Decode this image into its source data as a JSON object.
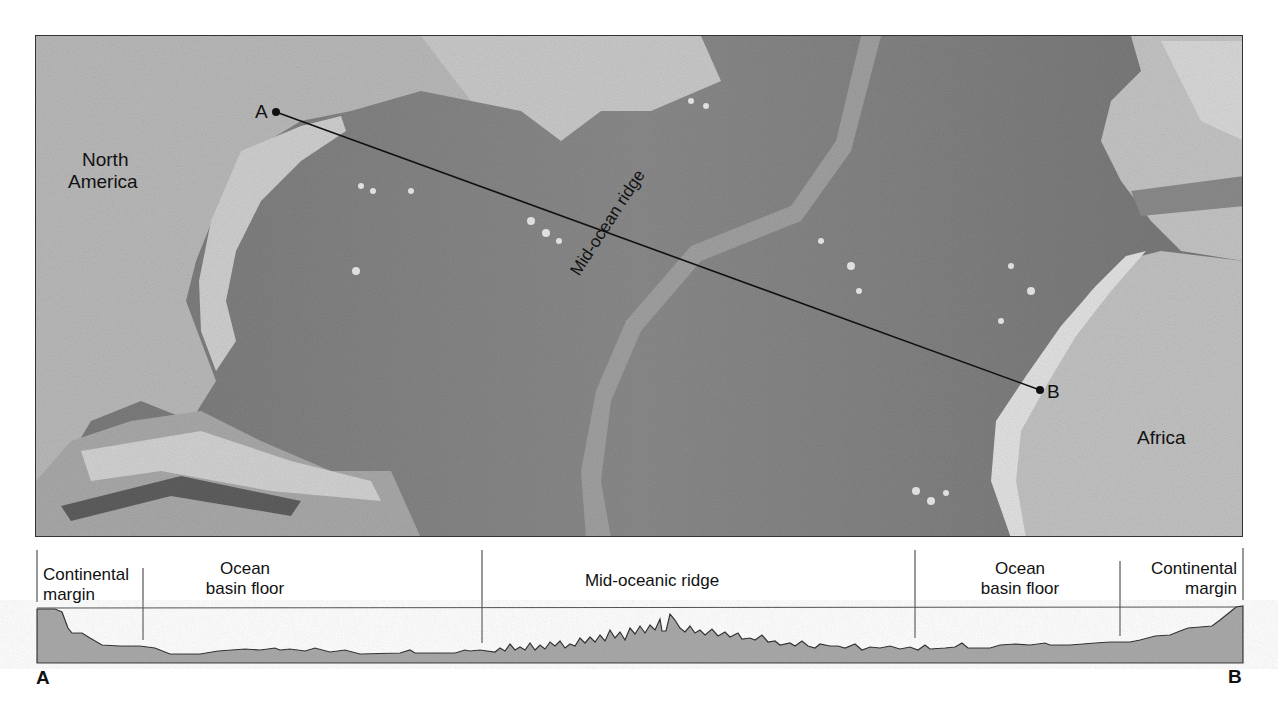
{
  "map": {
    "labels": {
      "north_america_line1": "North",
      "north_america_line2": "America",
      "africa": "Africa",
      "mid_ocean_ridge": "Mid-ocean ridge"
    },
    "transect": {
      "start_label": "A",
      "end_label": "B",
      "start_xy": [
        275,
        111
      ],
      "end_xy": [
        1039,
        389
      ]
    }
  },
  "profile": {
    "segments": [
      {
        "line1": "Continental",
        "line2": "margin",
        "align": "left"
      },
      {
        "line1": "Ocean",
        "line2": "basin floor",
        "align": "center"
      },
      {
        "line1": "Mid-oceanic ridge",
        "line2": "",
        "align": "center"
      },
      {
        "line1": "Ocean",
        "line2": "basin floor",
        "align": "center"
      },
      {
        "line1": "Continental",
        "line2": "margin",
        "align": "right"
      }
    ],
    "divider_x": [
      37,
      143,
      482,
      915,
      1120,
      1243
    ],
    "sea_level_y": 608,
    "base_y": 663,
    "end_labels": {
      "left": "A",
      "right": "B"
    },
    "fill_color": "#a9a9a9",
    "line_color": "#333333"
  }
}
